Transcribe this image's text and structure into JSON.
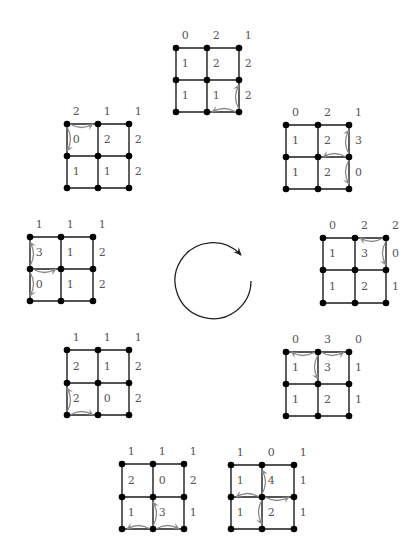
{
  "colors": {
    "edge": "#1a1a1a",
    "node": "#000000",
    "label": "#555555",
    "firing_arrow": "#8a8a8a",
    "cycle_arrow": "#222222"
  },
  "center_symbol": "clockwise-cycle-arrow",
  "grids": [
    {
      "name": "top",
      "labels": [
        [
          "0",
          "2",
          "1"
        ],
        [
          "1",
          "2",
          "2"
        ],
        [
          "1",
          "1",
          "2"
        ]
      ],
      "firing_node": [
        2,
        2
      ],
      "moves": [
        [
          [
            2,
            2
          ],
          [
            1,
            2
          ]
        ],
        [
          [
            2,
            2
          ],
          [
            2,
            1
          ]
        ]
      ]
    },
    {
      "name": "upper-right",
      "labels": [
        [
          "0",
          "2",
          "1"
        ],
        [
          "1",
          "2",
          "3"
        ],
        [
          "1",
          "2",
          "0"
        ]
      ],
      "firing_node": [
        1,
        2
      ],
      "moves": [
        [
          [
            1,
            2
          ],
          [
            0,
            2
          ]
        ],
        [
          [
            1,
            2
          ],
          [
            1,
            1
          ]
        ],
        [
          [
            1,
            2
          ],
          [
            2,
            2
          ]
        ]
      ]
    },
    {
      "name": "right",
      "labels": [
        [
          "0",
          "2",
          "2"
        ],
        [
          "1",
          "3",
          "0"
        ],
        [
          "1",
          "2",
          "1"
        ]
      ],
      "firing_node": [
        0,
        2
      ],
      "moves": [
        [
          [
            0,
            2
          ],
          [
            0,
            1
          ]
        ],
        [
          [
            0,
            2
          ],
          [
            1,
            2
          ]
        ]
      ]
    },
    {
      "name": "lower-right",
      "labels": [
        [
          "0",
          "3",
          "0"
        ],
        [
          "1",
          "3",
          "1"
        ],
        [
          "1",
          "2",
          "1"
        ]
      ],
      "firing_node": [
        0,
        1
      ],
      "moves": [
        [
          [
            0,
            1
          ],
          [
            0,
            0
          ]
        ],
        [
          [
            0,
            1
          ],
          [
            0,
            2
          ]
        ],
        [
          [
            0,
            1
          ],
          [
            1,
            1
          ]
        ]
      ]
    },
    {
      "name": "bottom-right",
      "labels": [
        [
          "1",
          "0",
          "1"
        ],
        [
          "1",
          "4",
          "1"
        ],
        [
          "1",
          "2",
          "1"
        ]
      ],
      "firing_node": [
        1,
        1
      ],
      "moves": [
        [
          [
            1,
            1
          ],
          [
            0,
            1
          ]
        ],
        [
          [
            1,
            1
          ],
          [
            1,
            0
          ]
        ],
        [
          [
            1,
            1
          ],
          [
            1,
            2
          ]
        ],
        [
          [
            1,
            1
          ],
          [
            2,
            1
          ]
        ]
      ]
    },
    {
      "name": "bottom-left",
      "labels": [
        [
          "1",
          "1",
          "1"
        ],
        [
          "2",
          "0",
          "2"
        ],
        [
          "1",
          "3",
          "1"
        ]
      ],
      "firing_node": [
        2,
        1
      ],
      "moves": [
        [
          [
            2,
            1
          ],
          [
            2,
            0
          ]
        ],
        [
          [
            2,
            1
          ],
          [
            2,
            2
          ]
        ],
        [
          [
            2,
            1
          ],
          [
            1,
            1
          ]
        ]
      ]
    },
    {
      "name": "lower-left",
      "labels": [
        [
          "1",
          "1",
          "1"
        ],
        [
          "2",
          "1",
          "2"
        ],
        [
          "2",
          "0",
          "2"
        ]
      ],
      "firing_node": [
        2,
        0
      ],
      "moves": [
        [
          [
            2,
            0
          ],
          [
            1,
            0
          ]
        ],
        [
          [
            2,
            0
          ],
          [
            2,
            1
          ]
        ]
      ]
    },
    {
      "name": "left",
      "labels": [
        [
          "1",
          "1",
          "1"
        ],
        [
          "3",
          "1",
          "2"
        ],
        [
          "0",
          "1",
          "2"
        ]
      ],
      "firing_node": [
        1,
        0
      ],
      "moves": [
        [
          [
            1,
            0
          ],
          [
            0,
            0
          ]
        ],
        [
          [
            1,
            0
          ],
          [
            1,
            1
          ]
        ],
        [
          [
            1,
            0
          ],
          [
            2,
            0
          ]
        ]
      ]
    },
    {
      "name": "upper-left",
      "labels": [
        [
          "2",
          "1",
          "1"
        ],
        [
          "0",
          "2",
          "2"
        ],
        [
          "1",
          "1",
          "2"
        ]
      ],
      "firing_node": [
        0,
        0
      ],
      "moves": [
        [
          [
            0,
            0
          ],
          [
            0,
            1
          ]
        ],
        [
          [
            0,
            0
          ],
          [
            1,
            0
          ]
        ]
      ]
    }
  ]
}
